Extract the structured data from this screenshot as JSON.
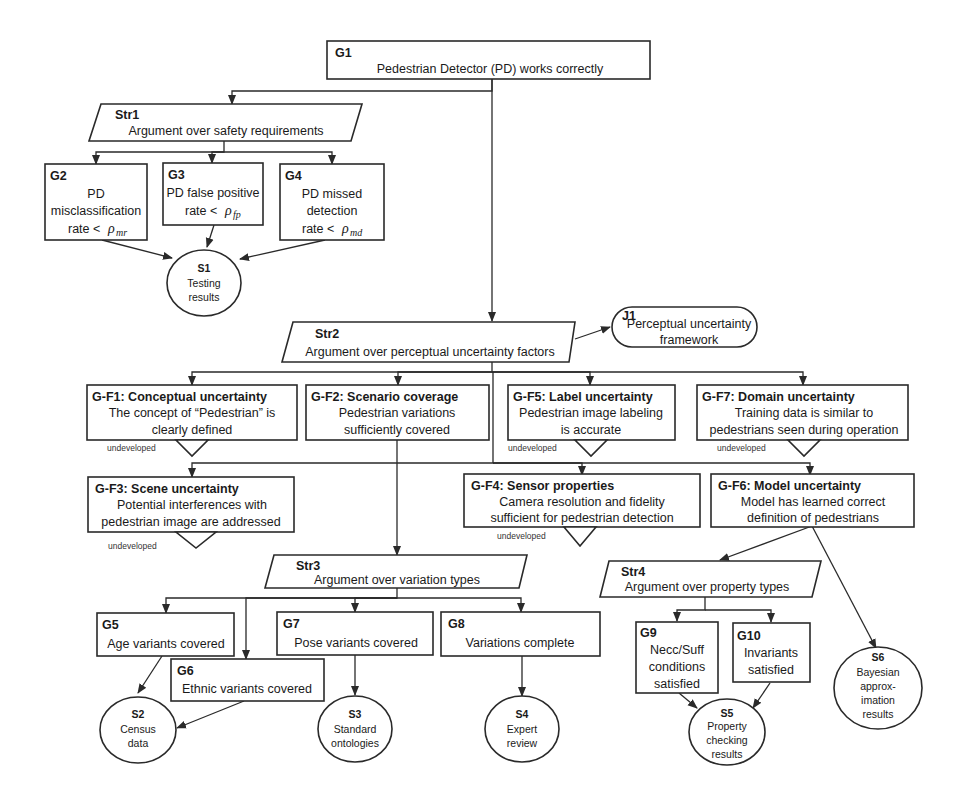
{
  "diagram": {
    "type": "GSN safety assurance case",
    "colors": {
      "stroke": "#2a2a2a",
      "text": "#1a1a1a",
      "background": "#ffffff"
    },
    "nodes": {
      "G1": {
        "id": "G1",
        "text": "Pedestrian Detector (PD) works correctly"
      },
      "Str1": {
        "id": "Str1",
        "text": "Argument over safety requirements"
      },
      "G2": {
        "id": "G2",
        "line1": "PD",
        "line2": "misclassification",
        "line3": "rate <",
        "rho": "ρ",
        "sub": "mr"
      },
      "G3": {
        "id": "G3",
        "line1": "PD false positive",
        "line2": "rate <",
        "rho": "ρ",
        "sub": "fp"
      },
      "G4": {
        "id": "G4",
        "line1": "PD missed",
        "line2": "detection",
        "line3": "rate <",
        "rho": "ρ",
        "sub": "md"
      },
      "S1": {
        "id": "S1",
        "line1": "Testing",
        "line2": "results"
      },
      "Str2": {
        "id": "Str2",
        "text": "Argument over perceptual uncertainty factors"
      },
      "J1": {
        "id": "J1",
        "line1": "Perceptual uncertainty",
        "line2": "framework"
      },
      "GF1": {
        "id": "G-F1: Conceptual uncertainty",
        "line1": "The concept of “Pedestrian” is",
        "line2": "clearly defined",
        "status": "undeveloped"
      },
      "GF2": {
        "id": "G-F2: Scenario coverage",
        "line1": "Pedestrian variations",
        "line2": "sufficiently covered"
      },
      "GF5": {
        "id": "G-F5: Label uncertainty",
        "line1": "Pedestrian image labeling",
        "line2": "is accurate",
        "status": "undeveloped"
      },
      "GF7": {
        "id": "G-F7: Domain uncertainty",
        "line1": "Training data is similar to",
        "line2": "pedestrians seen during operation",
        "status": "undeveloped"
      },
      "GF3": {
        "id": "G-F3: Scene uncertainty",
        "line1": "Potential interferences with",
        "line2": "pedestrian image are addressed",
        "status": "undeveloped"
      },
      "GF4": {
        "id": "G-F4: Sensor properties",
        "line1": "Camera resolution and fidelity",
        "line2": "sufficient for pedestrian detection",
        "status": "undeveloped"
      },
      "GF6": {
        "id": "G-F6: Model uncertainty",
        "line1": "Model has learned correct",
        "line2": "definition of pedestrians"
      },
      "Str3": {
        "id": "Str3",
        "text": "Argument over variation types"
      },
      "G5": {
        "id": "G5",
        "text": "Age variants covered"
      },
      "G6": {
        "id": "G6",
        "text": "Ethnic variants covered"
      },
      "G7": {
        "id": "G7",
        "text": "Pose variants covered"
      },
      "G8": {
        "id": "G8",
        "text": "Variations complete"
      },
      "S2": {
        "id": "S2",
        "line1": "Census",
        "line2": "data"
      },
      "S3": {
        "id": "S3",
        "line1": "Standard",
        "line2": "ontologies"
      },
      "S4": {
        "id": "S4",
        "line1": "Expert",
        "line2": "review"
      },
      "Str4": {
        "id": "Str4",
        "text": "Argument over property types"
      },
      "G9": {
        "id": "G9",
        "line1": "Necc/Suff",
        "line2": "conditions",
        "line3": "satisfied"
      },
      "G10": {
        "id": "G10",
        "line1": "Invariants",
        "line2": "satisfied"
      },
      "S5": {
        "id": "S5",
        "line1": "Property",
        "line2": "checking",
        "line3": "results"
      },
      "S6": {
        "id": "S6",
        "line1": "Bayesian",
        "line2": "approx-",
        "line3": "imation",
        "line4": "results"
      }
    },
    "edges": [
      [
        "G1",
        "Str1"
      ],
      [
        "G1",
        "Str2"
      ],
      [
        "Str1",
        "G2"
      ],
      [
        "Str1",
        "G3"
      ],
      [
        "Str1",
        "G4"
      ],
      [
        "G2",
        "S1"
      ],
      [
        "G3",
        "S1"
      ],
      [
        "G4",
        "S1"
      ],
      [
        "Str2",
        "J1"
      ],
      [
        "Str2",
        "GF1"
      ],
      [
        "Str2",
        "GF2"
      ],
      [
        "Str2",
        "GF5"
      ],
      [
        "Str2",
        "GF7"
      ],
      [
        "Str2",
        "GF3"
      ],
      [
        "Str2",
        "GF4"
      ],
      [
        "Str2",
        "GF6"
      ],
      [
        "GF2",
        "Str3"
      ],
      [
        "Str3",
        "G5"
      ],
      [
        "Str3",
        "G6"
      ],
      [
        "Str3",
        "G7"
      ],
      [
        "Str3",
        "G8"
      ],
      [
        "G5",
        "S2"
      ],
      [
        "G6",
        "S2"
      ],
      [
        "G7",
        "S3"
      ],
      [
        "G8",
        "S4"
      ],
      [
        "GF6",
        "Str4"
      ],
      [
        "GF6",
        "S6"
      ],
      [
        "Str4",
        "G9"
      ],
      [
        "Str4",
        "G10"
      ],
      [
        "G9",
        "S5"
      ],
      [
        "G10",
        "S5"
      ]
    ]
  }
}
